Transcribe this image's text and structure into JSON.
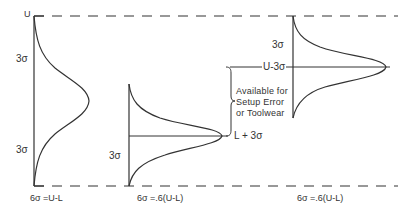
{
  "diagram": {
    "limits": {
      "upper_label": "U",
      "lower_label": "L"
    },
    "curves": [
      {
        "id": "curve-full",
        "top_sigma_label": "3σ",
        "bottom_sigma_label": "3σ",
        "caption": "6σ =U-L"
      },
      {
        "id": "curve-low",
        "sigma_label": "3σ",
        "mean_label": "L + 3σ",
        "caption": "6σ =.6(U-L)"
      },
      {
        "id": "curve-high",
        "sigma_label": "3σ",
        "mean_label": "U-3σ",
        "caption": "6σ =.6(U-L)"
      }
    ],
    "bracket_note": {
      "line1": "Available for",
      "line2": "Setup Error",
      "line3": "or Toolwear"
    },
    "colors": {
      "ink": "#333333",
      "background": "#ffffff"
    }
  }
}
